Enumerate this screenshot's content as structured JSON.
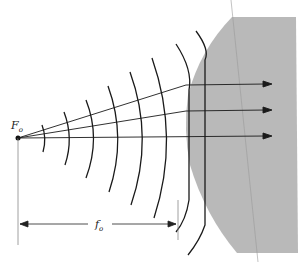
{
  "diagram": {
    "source_label": "F",
    "source_subscript": "o",
    "distance_label": "f",
    "distance_subscript": "o",
    "colors": {
      "lens": "#b9b9b9",
      "line": "#1a1a1a",
      "thin_line": "#888888",
      "background": "#ffffff"
    },
    "rays": 3,
    "wavefronts": 8
  }
}
